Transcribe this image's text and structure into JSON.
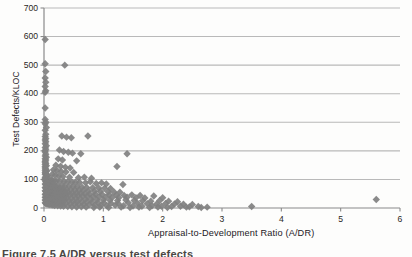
{
  "figure": {
    "caption": "Figure 7.5  A/DR versus test defects",
    "background_color": "#fdfdfc",
    "marker_color": "#808080",
    "gridline_color": "#b9b9b9",
    "axis_color": "#8a8a8a"
  },
  "chart_data": {
    "type": "scatter",
    "title": "",
    "xlabel": "Appraisal-to-Development Ratio (A/DR)",
    "ylabel": "Test Defects/KLOC",
    "xlim": [
      0,
      6
    ],
    "ylim": [
      0,
      700
    ],
    "xticks": [
      0,
      1,
      2,
      3,
      4,
      5,
      6
    ],
    "xtick_labels": [
      "0",
      "1",
      "2",
      "3",
      "4",
      "5",
      "6"
    ],
    "yticks": [
      0,
      100,
      200,
      300,
      400,
      500,
      600,
      700
    ],
    "ytick_labels": [
      "0",
      "100",
      "200",
      "300",
      "400",
      "500",
      "600",
      "700"
    ],
    "grid": "horizontal",
    "legend": "none",
    "marker": "diamond",
    "marker_size": 5,
    "series": [
      {
        "name": "Projects",
        "points": [
          [
            0.02,
            590
          ],
          [
            0.02,
            505
          ],
          [
            0.03,
            478
          ],
          [
            0.02,
            455
          ],
          [
            0.03,
            440
          ],
          [
            0.02,
            425
          ],
          [
            0.03,
            410
          ],
          [
            0.02,
            405
          ],
          [
            0.35,
            500
          ],
          [
            0.02,
            350
          ],
          [
            0.02,
            310
          ],
          [
            0.03,
            300
          ],
          [
            0.02,
            295
          ],
          [
            0.04,
            282
          ],
          [
            0.02,
            272
          ],
          [
            0.03,
            258
          ],
          [
            0.02,
            250
          ],
          [
            0.03,
            243
          ],
          [
            0.3,
            252
          ],
          [
            0.38,
            248
          ],
          [
            0.46,
            246
          ],
          [
            0.74,
            252
          ],
          [
            0.02,
            238
          ],
          [
            0.03,
            232
          ],
          [
            0.02,
            225
          ],
          [
            0.04,
            218
          ],
          [
            0.02,
            212
          ],
          [
            0.03,
            206
          ],
          [
            0.02,
            200
          ],
          [
            0.26,
            203
          ],
          [
            0.33,
            198
          ],
          [
            0.41,
            195
          ],
          [
            0.48,
            192
          ],
          [
            0.62,
            190
          ],
          [
            1.4,
            190
          ],
          [
            0.02,
            196
          ],
          [
            0.03,
            188
          ],
          [
            0.02,
            182
          ],
          [
            0.04,
            178
          ],
          [
            0.02,
            172
          ],
          [
            0.03,
            168
          ],
          [
            0.02,
            164
          ],
          [
            0.24,
            172
          ],
          [
            0.31,
            168
          ],
          [
            0.55,
            165
          ],
          [
            0.02,
            160
          ],
          [
            0.03,
            156
          ],
          [
            0.02,
            152
          ],
          [
            0.04,
            148
          ],
          [
            0.02,
            145
          ],
          [
            0.2,
            150
          ],
          [
            0.28,
            146
          ],
          [
            0.36,
            143
          ],
          [
            0.44,
            140
          ],
          [
            1.23,
            145
          ],
          [
            0.02,
            140
          ],
          [
            0.03,
            136
          ],
          [
            0.02,
            132
          ],
          [
            0.05,
            130
          ],
          [
            0.03,
            128
          ],
          [
            0.16,
            134
          ],
          [
            0.22,
            131
          ],
          [
            0.29,
            128
          ],
          [
            0.37,
            126
          ],
          [
            0.5,
            124
          ],
          [
            0.02,
            124
          ],
          [
            0.03,
            120
          ],
          [
            0.02,
            118
          ],
          [
            0.04,
            115
          ],
          [
            0.06,
            113
          ],
          [
            0.14,
            118
          ],
          [
            0.19,
            115
          ],
          [
            0.25,
            112
          ],
          [
            0.32,
            110
          ],
          [
            0.43,
            108
          ],
          [
            0.58,
            106
          ],
          [
            0.68,
            108
          ],
          [
            0.8,
            104
          ],
          [
            0.02,
            108
          ],
          [
            0.03,
            105
          ],
          [
            0.02,
            102
          ],
          [
            0.05,
            100
          ],
          [
            0.07,
            99
          ],
          [
            0.1,
            101
          ],
          [
            0.13,
            98
          ],
          [
            0.17,
            96
          ],
          [
            0.21,
            95
          ],
          [
            0.27,
            94
          ],
          [
            0.34,
            93
          ],
          [
            0.4,
            92
          ],
          [
            0.47,
            91
          ],
          [
            0.53,
            90
          ],
          [
            0.6,
            89
          ],
          [
            0.7,
            88
          ],
          [
            0.78,
            92
          ],
          [
            0.88,
            86
          ],
          [
            0.97,
            88
          ],
          [
            1.05,
            84
          ],
          [
            1.33,
            82
          ],
          [
            0.02,
            96
          ],
          [
            0.03,
            93
          ],
          [
            0.04,
            90
          ],
          [
            0.06,
            88
          ],
          [
            0.08,
            86
          ],
          [
            0.11,
            84
          ],
          [
            0.15,
            82
          ],
          [
            0.18,
            80
          ],
          [
            0.23,
            79
          ],
          [
            0.3,
            78
          ],
          [
            0.35,
            77
          ],
          [
            0.42,
            76
          ],
          [
            0.49,
            75
          ],
          [
            0.56,
            74
          ],
          [
            0.64,
            73
          ],
          [
            0.72,
            72
          ],
          [
            0.82,
            71
          ],
          [
            0.92,
            70
          ],
          [
            1.02,
            69
          ],
          [
            1.12,
            68
          ],
          [
            0.02,
            84
          ],
          [
            0.03,
            81
          ],
          [
            0.05,
            79
          ],
          [
            0.07,
            77
          ],
          [
            0.09,
            75
          ],
          [
            0.12,
            73
          ],
          [
            0.16,
            71
          ],
          [
            0.2,
            70
          ],
          [
            0.24,
            68
          ],
          [
            0.28,
            67
          ],
          [
            0.33,
            66
          ],
          [
            0.38,
            65
          ],
          [
            0.45,
            64
          ],
          [
            0.52,
            63
          ],
          [
            0.59,
            62
          ],
          [
            0.66,
            61
          ],
          [
            0.75,
            60
          ],
          [
            0.85,
            59
          ],
          [
            0.95,
            58
          ],
          [
            1.08,
            57
          ],
          [
            1.18,
            56
          ],
          [
            1.28,
            55
          ],
          [
            0.02,
            72
          ],
          [
            0.03,
            70
          ],
          [
            0.04,
            68
          ],
          [
            0.06,
            66
          ],
          [
            0.08,
            64
          ],
          [
            0.1,
            62
          ],
          [
            0.13,
            61
          ],
          [
            0.17,
            59
          ],
          [
            0.22,
            58
          ],
          [
            0.26,
            57
          ],
          [
            0.31,
            56
          ],
          [
            0.36,
            55
          ],
          [
            0.41,
            54
          ],
          [
            0.48,
            53
          ],
          [
            0.55,
            52
          ],
          [
            0.62,
            51
          ],
          [
            0.69,
            50
          ],
          [
            0.77,
            49
          ],
          [
            0.87,
            48
          ],
          [
            0.98,
            47
          ],
          [
            1.1,
            46
          ],
          [
            1.22,
            45
          ],
          [
            1.35,
            44
          ],
          [
            1.48,
            46
          ],
          [
            1.62,
            44
          ],
          [
            0.02,
            60
          ],
          [
            0.03,
            58
          ],
          [
            0.05,
            56
          ],
          [
            0.07,
            55
          ],
          [
            0.09,
            53
          ],
          [
            0.11,
            52
          ],
          [
            0.14,
            51
          ],
          [
            0.18,
            50
          ],
          [
            0.23,
            49
          ],
          [
            0.27,
            48
          ],
          [
            0.32,
            47
          ],
          [
            0.37,
            46
          ],
          [
            0.43,
            45
          ],
          [
            0.5,
            44
          ],
          [
            0.57,
            43
          ],
          [
            0.65,
            42
          ],
          [
            0.73,
            41
          ],
          [
            0.83,
            40
          ],
          [
            0.93,
            39
          ],
          [
            1.04,
            38
          ],
          [
            1.15,
            37
          ],
          [
            1.26,
            36
          ],
          [
            1.4,
            38
          ],
          [
            1.55,
            36
          ],
          [
            1.7,
            35
          ],
          [
            1.85,
            42
          ],
          [
            2.0,
            36
          ],
          [
            0.02,
            48
          ],
          [
            0.03,
            46
          ],
          [
            0.04,
            45
          ],
          [
            0.06,
            44
          ],
          [
            0.08,
            43
          ],
          [
            0.1,
            42
          ],
          [
            0.12,
            41
          ],
          [
            0.15,
            40
          ],
          [
            0.19,
            39
          ],
          [
            0.24,
            38
          ],
          [
            0.29,
            37
          ],
          [
            0.34,
            36
          ],
          [
            0.39,
            35
          ],
          [
            0.46,
            34
          ],
          [
            0.54,
            33
          ],
          [
            0.61,
            32
          ],
          [
            0.7,
            31
          ],
          [
            0.79,
            30
          ],
          [
            0.89,
            29
          ],
          [
            1.0,
            28
          ],
          [
            1.11,
            27
          ],
          [
            1.24,
            26
          ],
          [
            1.38,
            28
          ],
          [
            1.52,
            26
          ],
          [
            1.66,
            25
          ],
          [
            1.8,
            24
          ],
          [
            1.95,
            26
          ],
          [
            2.1,
            24
          ],
          [
            2.25,
            22
          ],
          [
            0.02,
            38
          ],
          [
            0.03,
            36
          ],
          [
            0.05,
            35
          ],
          [
            0.07,
            34
          ],
          [
            0.09,
            33
          ],
          [
            0.11,
            32
          ],
          [
            0.13,
            31
          ],
          [
            0.16,
            30
          ],
          [
            0.21,
            29
          ],
          [
            0.25,
            28
          ],
          [
            0.3,
            27
          ],
          [
            0.35,
            26
          ],
          [
            0.42,
            25
          ],
          [
            0.49,
            24
          ],
          [
            0.56,
            23
          ],
          [
            0.64,
            22
          ],
          [
            0.72,
            21
          ],
          [
            0.81,
            20
          ],
          [
            0.91,
            19
          ],
          [
            1.01,
            18
          ],
          [
            1.13,
            17
          ],
          [
            1.25,
            16
          ],
          [
            1.42,
            18
          ],
          [
            1.58,
            16
          ],
          [
            1.74,
            15
          ],
          [
            1.9,
            14
          ],
          [
            2.05,
            16
          ],
          [
            2.2,
            14
          ],
          [
            2.35,
            13
          ],
          [
            2.5,
            12
          ],
          [
            0.02,
            28
          ],
          [
            0.03,
            26
          ],
          [
            0.04,
            25
          ],
          [
            0.06,
            24
          ],
          [
            0.08,
            23
          ],
          [
            0.1,
            22
          ],
          [
            0.14,
            21
          ],
          [
            0.17,
            20
          ],
          [
            0.22,
            19
          ],
          [
            0.26,
            18
          ],
          [
            0.31,
            17
          ],
          [
            0.36,
            16
          ],
          [
            0.44,
            15
          ],
          [
            0.51,
            14
          ],
          [
            0.58,
            13
          ],
          [
            0.67,
            12
          ],
          [
            0.76,
            11
          ],
          [
            0.86,
            10
          ],
          [
            0.96,
            9
          ],
          [
            1.06,
            8
          ],
          [
            1.2,
            10
          ],
          [
            1.34,
            8
          ],
          [
            1.5,
            7
          ],
          [
            1.65,
            6
          ],
          [
            1.82,
            8
          ],
          [
            1.98,
            6
          ],
          [
            2.15,
            5
          ],
          [
            2.3,
            6
          ],
          [
            2.45,
            4
          ],
          [
            2.6,
            5
          ],
          [
            2.75,
            3
          ],
          [
            0.02,
            18
          ],
          [
            0.03,
            16
          ],
          [
            0.05,
            14
          ],
          [
            0.07,
            13
          ],
          [
            0.09,
            12
          ],
          [
            0.12,
            11
          ],
          [
            0.15,
            10
          ],
          [
            0.18,
            9
          ],
          [
            0.23,
            8
          ],
          [
            0.28,
            7
          ],
          [
            0.33,
            6
          ],
          [
            0.4,
            5
          ],
          [
            0.47,
            4
          ],
          [
            0.55,
            3
          ],
          [
            0.63,
            4
          ],
          [
            0.71,
            3
          ],
          [
            0.84,
            2
          ],
          [
            0.94,
            3
          ],
          [
            1.09,
            2
          ],
          [
            1.3,
            3
          ],
          [
            1.45,
            2
          ],
          [
            1.6,
            3
          ],
          [
            1.78,
            2
          ],
          [
            1.92,
            3
          ],
          [
            2.08,
            2
          ],
          [
            2.4,
            3
          ],
          [
            2.65,
            2
          ],
          [
            3.5,
            5
          ],
          [
            5.6,
            30
          ]
        ]
      }
    ],
    "notable_outliers": [
      {
        "x": 0.02,
        "y": 590,
        "note": "highest defect density"
      },
      {
        "x": 0.35,
        "y": 500
      },
      {
        "x": 3.5,
        "y": 5,
        "note": "high A/DR, near-zero defects"
      },
      {
        "x": 5.6,
        "y": 30,
        "note": "far right outlier"
      }
    ]
  }
}
